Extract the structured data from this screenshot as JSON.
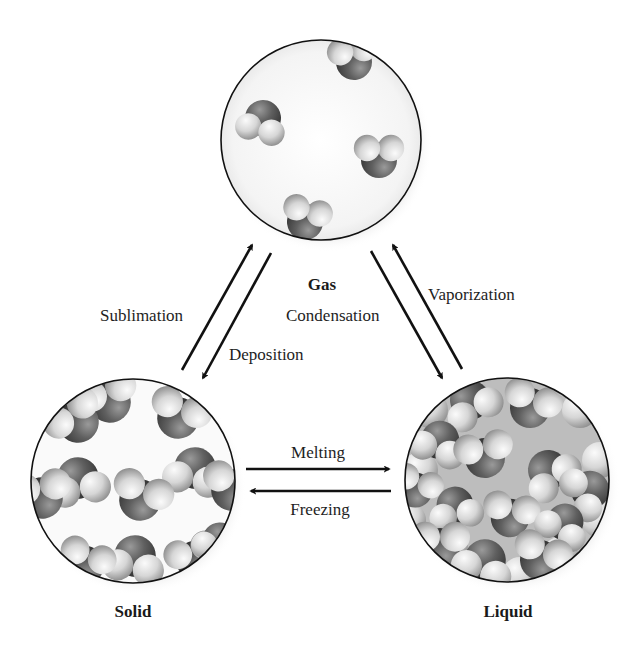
{
  "diagram": {
    "type": "phase-transition-cycle",
    "states": {
      "gas": {
        "label": "Gas"
      },
      "solid": {
        "label": "Solid"
      },
      "liquid": {
        "label": "Liquid"
      }
    },
    "transitions": {
      "sublimation": {
        "label": "Sublimation",
        "from": "Solid",
        "to": "Gas"
      },
      "deposition": {
        "label": "Deposition",
        "from": "Gas",
        "to": "Solid"
      },
      "condensation": {
        "label": "Condensation",
        "from": "Gas",
        "to": "Liquid"
      },
      "vaporization": {
        "label": "Vaporization",
        "from": "Liquid",
        "to": "Gas"
      },
      "melting": {
        "label": "Melting",
        "from": "Solid",
        "to": "Liquid"
      },
      "freezing": {
        "label": "Freezing",
        "from": "Liquid",
        "to": "Solid"
      }
    },
    "colors": {
      "outline": "#111111",
      "molecule_dark": "#5a5a5a",
      "molecule_light": "#d8d8d8",
      "background": "#ffffff"
    }
  }
}
